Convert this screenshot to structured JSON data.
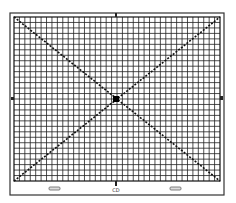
{
  "diagram": {
    "type": "test-grid-chart",
    "grid": {
      "cols": 38,
      "rows": 30,
      "line_color": "#222222",
      "background": "#ffffff"
    },
    "diagonals": [
      {
        "name": "descending-diagonal",
        "from": "top-left",
        "to": "bottom-right",
        "style": "dotted-dark"
      },
      {
        "name": "ascending-diagonal",
        "from": "bottom-left",
        "to": "top-right",
        "style": "dotted-dark"
      }
    ],
    "center_marker": "filled-square",
    "edge_markers": [
      "top",
      "bottom",
      "left",
      "right"
    ],
    "bottom_labels": {
      "center": "CD"
    },
    "bottom_slots": 2
  }
}
